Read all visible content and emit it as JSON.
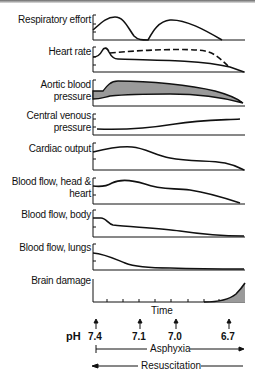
{
  "diagram": {
    "panels": [
      {
        "label_lines": [
          "Respiratory effort"
        ]
      },
      {
        "label_lines": [
          "Heart rate"
        ]
      },
      {
        "label_lines": [
          "Aortic blood",
          "pressure"
        ]
      },
      {
        "label_lines": [
          "Central venous",
          "pressure"
        ]
      },
      {
        "label_lines": [
          "Cardiac output"
        ]
      },
      {
        "label_lines": [
          "Blood flow, head &",
          "heart"
        ]
      },
      {
        "label_lines": [
          "Blood flow, body"
        ]
      },
      {
        "label_lines": [
          "Blood flow, lungs"
        ]
      },
      {
        "label_lines": [
          "Brain damage"
        ]
      }
    ],
    "x_axis_label": "Time",
    "ph_label": "pH",
    "ph_markers": [
      "7.4",
      "7.1",
      "7.0",
      "6.7"
    ],
    "asphyxia_label": "Asphyxia",
    "resuscitation_label": "Resuscitation",
    "colors": {
      "line": "#111111",
      "fill": "#9a9a9a"
    }
  }
}
